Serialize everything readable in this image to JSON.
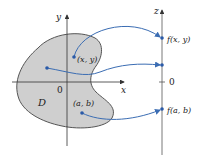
{
  "diagram": {
    "type": "function-mapping",
    "colors": {
      "region_fill": "#cfcfcf",
      "region_stroke": "#555555",
      "axis": "#333333",
      "arrow": "#3b6db3",
      "point": "#2a5aa8"
    },
    "xy_plane": {
      "x_axis_label": "x",
      "y_axis_label": "y",
      "origin_label": "0",
      "region_label": "D"
    },
    "z_axis": {
      "axis_label": "z",
      "origin_label": "0"
    },
    "points": [
      {
        "id": "xy",
        "label": "(x, y)",
        "image_label": "f(x, y)"
      },
      {
        "id": "unlabeled",
        "label": "",
        "image_label": ""
      },
      {
        "id": "ab",
        "label": "(a, b)",
        "image_label": "f(a, b)"
      }
    ]
  }
}
